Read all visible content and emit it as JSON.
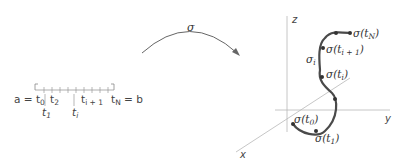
{
  "interval": {
    "left_eq": "a = t",
    "left_sub": "0",
    "t1": "t",
    "t1_sub": "1",
    "t2": "t",
    "t2_sub": "2",
    "ti": "t",
    "ti_sub": "i",
    "ti1": "t",
    "ti1_sub": "i + 1",
    "tN": "t",
    "tN_sub": "N",
    "right_eq": " = b"
  },
  "map_arrow": {
    "label": "σ"
  },
  "axes": {
    "x": "x",
    "y": "y",
    "z": "z"
  },
  "curve_labels": {
    "sigma_t0": "σ(t",
    "sigma_t0_sub": "0",
    "sigma_t1": "σ(t",
    "sigma_t1_sub": "1",
    "sigma_ti": "σ(t",
    "sigma_ti_sub": "i",
    "sigma_ti1": "σ(t",
    "sigma_ti1_sub": "i + 1",
    "sigma_tN": "σ(t",
    "sigma_tN_sub": "N",
    "close": ")",
    "sigma_i": "σ",
    "sigma_i_sub": "i"
  },
  "colors": {
    "curve": "#4a4a4a",
    "axis": "#b8b8b8",
    "text": "#444444"
  }
}
